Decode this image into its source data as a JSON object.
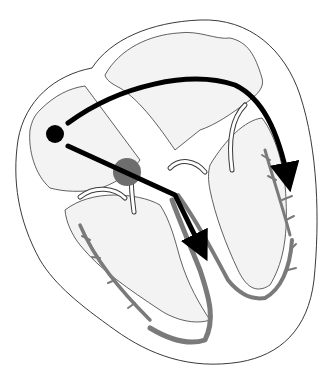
{
  "diagram": {
    "labels": [],
    "colors": {
      "background": "#ffffff",
      "chamber_fill": "#f3f3f3",
      "wall_fill": "#ffffff",
      "outline": "#3a3a3a",
      "conduction_fibers": "#7a7a7a",
      "av_node": "#6e6e6e",
      "signal_arrows": "#000000"
    },
    "components": [
      {
        "id": "sa-node",
        "shape": "dot",
        "position": "left atrium region"
      },
      {
        "id": "av-node",
        "shape": "gray-circle",
        "position": "center junction"
      },
      {
        "id": "arrow-atria",
        "shape": "curved-arrow",
        "direction": "left to right down"
      },
      {
        "id": "arrow-septum",
        "shape": "straight-arrow",
        "direction": "down along septum"
      },
      {
        "id": "purkinje-fibers",
        "shape": "branching-gray-bands"
      }
    ]
  }
}
